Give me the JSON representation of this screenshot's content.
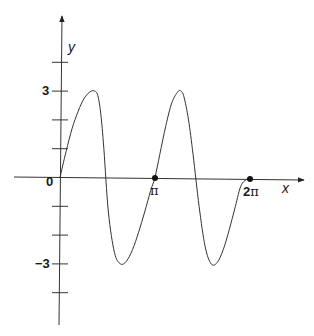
{
  "chart_data": {
    "type": "line",
    "title": "",
    "xlabel": "x",
    "ylabel": "y",
    "x_ticks": [
      {
        "value": 0,
        "label": "0"
      },
      {
        "value": 3.14159,
        "label": "π"
      },
      {
        "value": 6.28318,
        "label": "2π",
        "label_prefix": "2",
        "label_suffix": "π"
      }
    ],
    "y_ticks": [
      -4,
      -3,
      -2,
      -1,
      1,
      2,
      3,
      4
    ],
    "y_tick_labels": [
      {
        "value": 3,
        "label": "3"
      },
      {
        "value": -3,
        "label": "−3"
      }
    ],
    "ylim": [
      -5,
      5.5
    ],
    "xlim": [
      -1.4,
      7.8
    ],
    "grid": false,
    "legend": null,
    "marked_points": [
      {
        "x": 3.14159,
        "y": 0
      },
      {
        "x": 6.28318,
        "y": 0
      }
    ],
    "series": [
      {
        "name": "curve",
        "color": "#333333",
        "x": [
          0,
          0.2,
          0.4,
          0.6,
          0.8,
          1.0,
          1.15,
          1.25,
          1.35,
          1.45,
          1.6,
          1.8,
          2.0,
          2.2,
          2.4,
          2.6,
          2.8,
          3.0,
          3.14,
          3.3,
          3.5,
          3.7,
          3.9,
          4.0,
          4.1,
          4.25,
          4.4,
          4.6,
          4.8,
          5.0,
          5.2,
          5.4,
          5.6,
          5.8,
          6.0,
          6.28
        ],
        "y": [
          0,
          0.9,
          1.7,
          2.3,
          2.75,
          2.98,
          3.0,
          2.85,
          2.2,
          1.0,
          -1.2,
          -2.6,
          -3.0,
          -2.9,
          -2.5,
          -1.9,
          -1.2,
          -0.45,
          0,
          0.8,
          1.8,
          2.6,
          2.98,
          3.0,
          2.8,
          2.0,
          0.8,
          -1.0,
          -2.4,
          -3.0,
          -2.95,
          -2.5,
          -1.8,
          -1.0,
          -0.25,
          0
        ]
      }
    ]
  },
  "labels": {
    "x_axis": "x",
    "y_axis": "y",
    "origin": "0",
    "pi": "π",
    "two_pi_num": "2",
    "two_pi_sym": "π",
    "y_pos_three": "3",
    "y_neg_three": "−3"
  }
}
